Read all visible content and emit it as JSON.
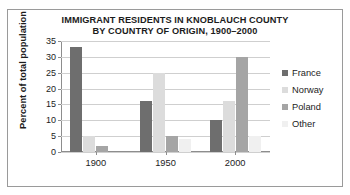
{
  "chart_data": {
    "type": "bar",
    "title": "IMMIGRANT RESIDENTS IN KNOBLAUCH COUNTY BY COUNTRY OF ORIGIN, 1900–2000",
    "title_lines": [
      "IMMIGRANT RESIDENTS IN KNOBLAUCH COUNTY",
      "BY COUNTRY OF ORIGIN, 1900–2000"
    ],
    "xlabel": "",
    "ylabel": "Percent of total population",
    "categories": [
      "1900",
      "1950",
      "2000"
    ],
    "ylim": [
      0,
      35
    ],
    "yticks": [
      0,
      5,
      10,
      15,
      20,
      25,
      30,
      35
    ],
    "ytick_labels": [
      "0",
      "5",
      "10",
      "15",
      "20",
      "25",
      "30",
      "35"
    ],
    "grid": true,
    "grid_axis": "y",
    "legend_position": "right",
    "series": [
      {
        "name": "France",
        "color": "#6e6e6e",
        "values": [
          33,
          16,
          10
        ]
      },
      {
        "name": "Norway",
        "color": "#dcdcdc",
        "values": [
          5,
          25,
          16
        ]
      },
      {
        "name": "Poland",
        "color": "#a5a5a5",
        "values": [
          2,
          5,
          30
        ]
      },
      {
        "name": "Other",
        "color": "#f0f0f0",
        "values": [
          0,
          4,
          5
        ]
      }
    ]
  },
  "legend": {
    "entries": [
      {
        "label": "France"
      },
      {
        "label": "Norway"
      },
      {
        "label": "Poland"
      },
      {
        "label": "Other"
      }
    ]
  },
  "colors": {
    "frame": "#9a9a9a",
    "axis": "#8d8d8d",
    "gridline": "#cfcfcf",
    "text": "#1c1c1c",
    "background": "#ffffff"
  }
}
